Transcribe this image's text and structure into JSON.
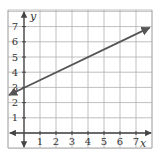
{
  "chart_data": {
    "type": "line",
    "title": "",
    "xlabel": "x",
    "ylabel": "y",
    "xlim": [
      -1,
      8
    ],
    "ylim": [
      -1,
      8
    ],
    "grid": true,
    "x_ticks": [
      "1",
      "2",
      "3",
      "4",
      "5",
      "6",
      "7"
    ],
    "y_ticks": [
      "1",
      "2",
      "3",
      "4",
      "5",
      "6",
      "7"
    ],
    "series": [
      {
        "name": "y = 0.5x + 3",
        "slope": 0.5,
        "intercept": 3,
        "x": [
          -1,
          7.85
        ],
        "y": [
          2.5,
          6.93
        ],
        "arrows": "both"
      }
    ]
  },
  "colors": {
    "grid": "#b0b0b0",
    "axis": "#444444",
    "line": "#555555"
  }
}
